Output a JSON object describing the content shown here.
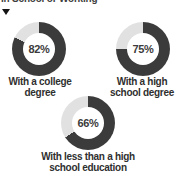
{
  "page": {
    "background": "#ffffff"
  },
  "header": {
    "clipped_title": "In School or Working",
    "dropdown_marker": "collapse-triangle"
  },
  "chart_data": {
    "type": "pie",
    "subtype": "donut",
    "title": "In School or Working",
    "unit": "%",
    "legend_position": "below-each-donut",
    "colors": {
      "filled": "#3b3b3b",
      "remainder": "#e1e1e1"
    },
    "series": [
      {
        "name": "With a college degree",
        "value": 82,
        "display": "82%",
        "caption_line1": "With a college",
        "caption_line2": "degree"
      },
      {
        "name": "With a high school degree",
        "value": 75,
        "display": "75%",
        "caption_line1": "With a high",
        "caption_line2": "school degree"
      },
      {
        "name": "With less than a high school education",
        "value": 66,
        "display": "66%",
        "caption_line1": "With less than a high",
        "caption_line2": "school education"
      }
    ]
  }
}
